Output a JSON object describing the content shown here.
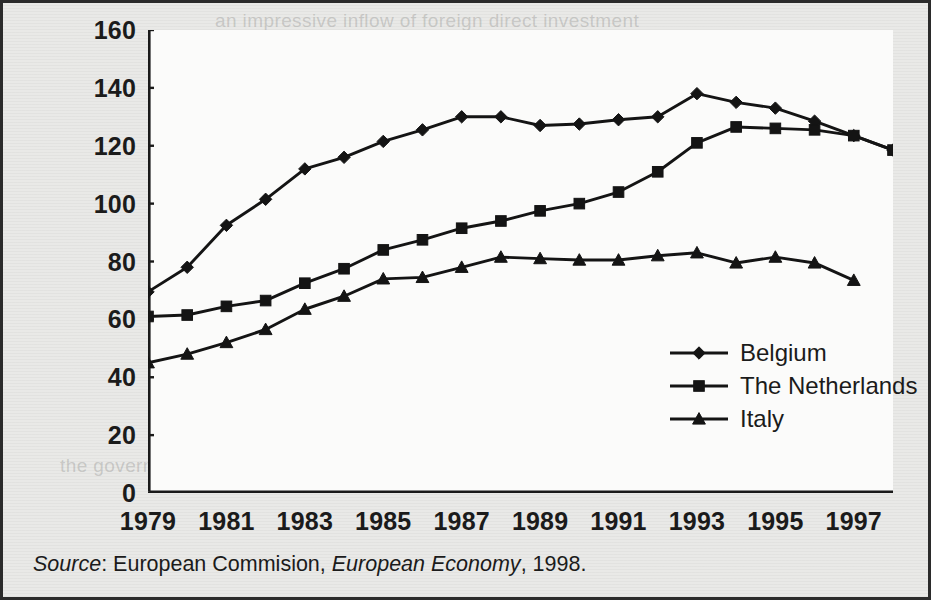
{
  "chart_data": {
    "type": "line",
    "title": "",
    "xlabel": "",
    "ylabel": "",
    "x": [
      1979,
      1980,
      1981,
      1982,
      1983,
      1984,
      1985,
      1986,
      1987,
      1988,
      1989,
      1990,
      1991,
      1992,
      1993,
      1994,
      1995,
      1996,
      1997,
      1998
    ],
    "xtick_labels": [
      "1979",
      "1981",
      "1983",
      "1985",
      "1987",
      "1989",
      "1991",
      "1993",
      "1995",
      "1997"
    ],
    "xtick_values": [
      1979,
      1981,
      1983,
      1985,
      1987,
      1989,
      1991,
      1993,
      1995,
      1997
    ],
    "xlim": [
      1979,
      1998
    ],
    "ylim": [
      0,
      160
    ],
    "ytick_labels": [
      "0",
      "20",
      "40",
      "60",
      "80",
      "100",
      "120",
      "140",
      "160"
    ],
    "ytick_values": [
      0,
      20,
      40,
      60,
      80,
      100,
      120,
      140,
      160
    ],
    "grid": false,
    "legend_position": "center-right",
    "series": [
      {
        "name": "Belgium",
        "marker": "diamond",
        "x": [
          1979,
          1980,
          1981,
          1982,
          1983,
          1984,
          1985,
          1986,
          1987,
          1988,
          1989,
          1990,
          1991,
          1992,
          1993,
          1994,
          1995,
          1996,
          1997,
          1998
        ],
        "values": [
          69.5,
          78,
          92.5,
          101.5,
          112,
          116,
          121.5,
          125.5,
          130,
          130,
          127,
          127.5,
          129,
          130,
          138,
          135,
          133,
          128.5,
          123.5,
          118.5
        ]
      },
      {
        "name": "The Netherlands",
        "marker": "square",
        "x": [
          1979,
          1980,
          1981,
          1982,
          1983,
          1984,
          1985,
          1986,
          1987,
          1988,
          1989,
          1990,
          1991,
          1992,
          1993,
          1994,
          1995,
          1996,
          1997,
          1998
        ],
        "values": [
          61,
          61.5,
          64.5,
          66.5,
          72.5,
          77.5,
          84,
          87.5,
          91.5,
          94,
          97.5,
          100,
          104,
          111,
          121,
          126.5,
          126,
          125.5,
          123.5,
          118.5
        ]
      },
      {
        "name": "Italy",
        "marker": "triangle",
        "x": [
          1979,
          1980,
          1981,
          1982,
          1983,
          1984,
          1985,
          1986,
          1987,
          1988,
          1989,
          1990,
          1991,
          1992,
          1993,
          1994,
          1995,
          1996,
          1997
        ],
        "values": [
          45,
          48,
          52,
          56.5,
          63.5,
          68,
          74,
          74.5,
          78,
          81.5,
          81,
          80.5,
          80.5,
          82,
          83,
          79.5,
          81.5,
          79.5,
          73.5
        ]
      }
    ],
    "source_note": {
      "label": "Source",
      "publisher": "European Commision",
      "publication": "European Economy",
      "year": "1998"
    }
  },
  "bleed_text": {
    "lines": [
      "an impressive inflow of foreign direct investment",
      "relatively low labour costs and a well-educated",
      "the government has pursued a cautious fiscal"
    ]
  }
}
